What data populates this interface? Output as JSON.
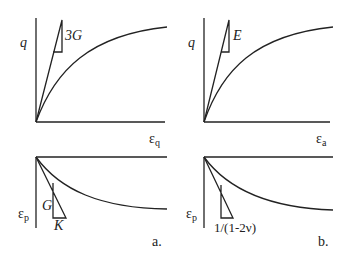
{
  "panels": {
    "a": {
      "label": "a.",
      "top": {
        "y_label": "q",
        "x_label_main": "ε",
        "x_label_sub": "q",
        "slope_label": "3G"
      },
      "bottom": {
        "y_label_main": "ε",
        "y_label_sub": "p",
        "slope_label_vertical": "G",
        "slope_label_horizontal": "K"
      }
    },
    "b": {
      "label": "b.",
      "top": {
        "y_label": "q",
        "x_label_main": "ε",
        "x_label_sub": "a",
        "slope_label": "E"
      },
      "bottom": {
        "y_label_main": "ε",
        "y_label_sub": "p",
        "slope_label": "1/(1-2ν)"
      }
    }
  },
  "colors": {
    "line": "#222222",
    "background": "#ffffff"
  }
}
